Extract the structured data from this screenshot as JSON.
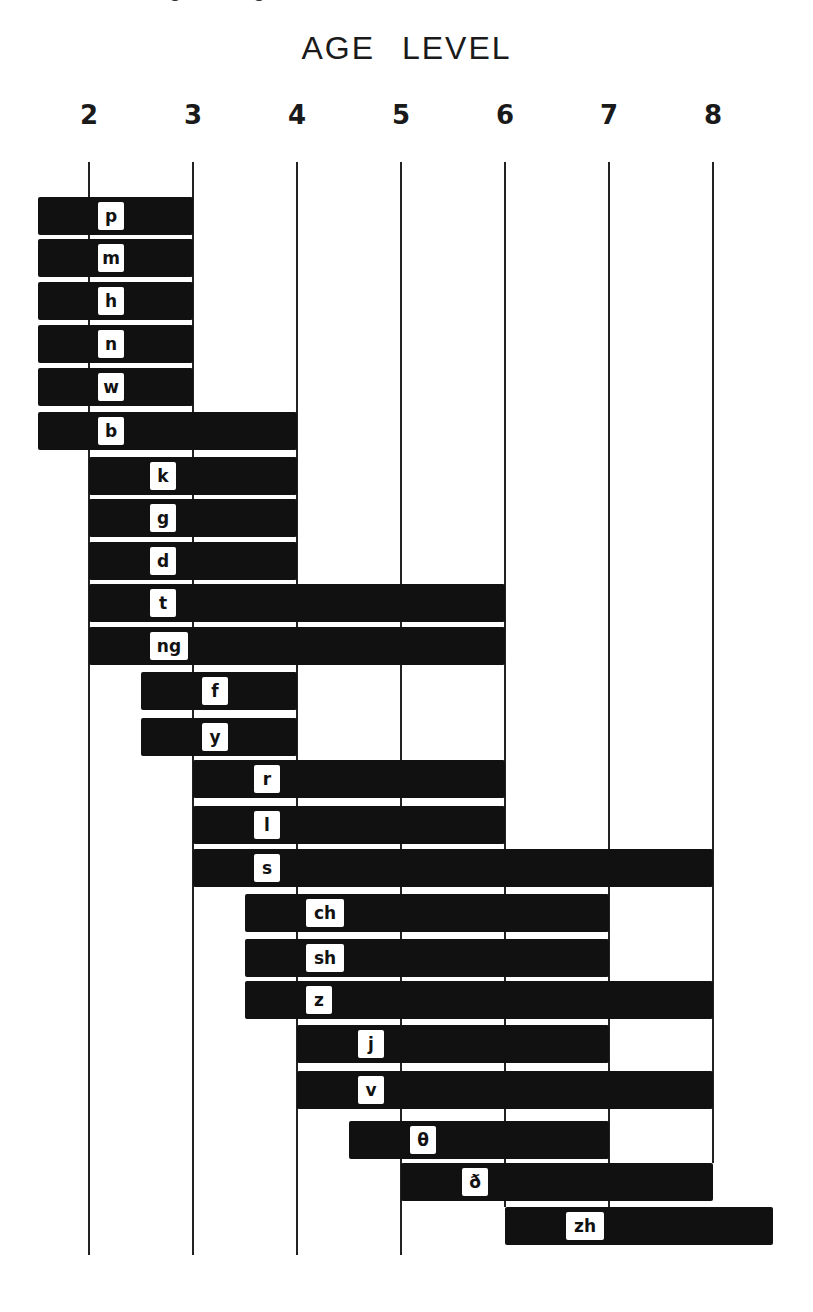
{
  "chart_data": {
    "type": "bar",
    "subtype": "horizontal range (floating) bar chart",
    "title": "AGE LEVEL",
    "xlabel": "AGE LEVEL",
    "ylabel": "",
    "x_ticks": [
      2,
      3,
      4,
      5,
      6,
      7,
      8
    ],
    "xlim": [
      1.5,
      8.6
    ],
    "grid": "vertical lines at each integer age",
    "legend": null,
    "categories": [
      "p",
      "m",
      "h",
      "n",
      "w",
      "b",
      "k",
      "g",
      "d",
      "t",
      "ng",
      "f",
      "y",
      "r",
      "l",
      "s",
      "ch",
      "sh",
      "z",
      "j",
      "v",
      "θ",
      "ð",
      "zh"
    ],
    "series": [
      {
        "name": "age range",
        "ranges": [
          {
            "sound": "p",
            "start": 1.5,
            "end": 3
          },
          {
            "sound": "m",
            "start": 1.5,
            "end": 3
          },
          {
            "sound": "h",
            "start": 1.5,
            "end": 3
          },
          {
            "sound": "n",
            "start": 1.5,
            "end": 3
          },
          {
            "sound": "w",
            "start": 1.5,
            "end": 3
          },
          {
            "sound": "b",
            "start": 1.5,
            "end": 4
          },
          {
            "sound": "k",
            "start": 2,
            "end": 4
          },
          {
            "sound": "g",
            "start": 2,
            "end": 4
          },
          {
            "sound": "d",
            "start": 2,
            "end": 4
          },
          {
            "sound": "t",
            "start": 2,
            "end": 6
          },
          {
            "sound": "ng",
            "start": 2,
            "end": 6
          },
          {
            "sound": "f",
            "start": 2.5,
            "end": 4
          },
          {
            "sound": "y",
            "start": 2.5,
            "end": 4
          },
          {
            "sound": "r",
            "start": 3,
            "end": 6
          },
          {
            "sound": "l",
            "start": 3,
            "end": 6
          },
          {
            "sound": "s",
            "start": 3,
            "end": 8
          },
          {
            "sound": "ch",
            "start": 3.5,
            "end": 7
          },
          {
            "sound": "sh",
            "start": 3.5,
            "end": 7
          },
          {
            "sound": "z",
            "start": 3.5,
            "end": 8
          },
          {
            "sound": "j",
            "start": 4,
            "end": 7
          },
          {
            "sound": "v",
            "start": 4,
            "end": 8
          },
          {
            "sound": "θ",
            "start": 4.5,
            "end": 7
          },
          {
            "sound": "ð",
            "start": 5,
            "end": 8
          },
          {
            "sound": "zh",
            "start": 6,
            "end": 8.5
          }
        ]
      }
    ]
  },
  "colors": {
    "bar": "#111111",
    "label_box": "#ffffff",
    "gridline": "#222222",
    "background": "#ffffff"
  }
}
